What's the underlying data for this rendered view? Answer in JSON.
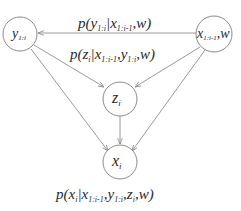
{
  "diagram": {
    "type": "graphical-model",
    "nodes": [
      {
        "id": "y",
        "main": "y",
        "sub": "1:i",
        "tail": ""
      },
      {
        "id": "xw",
        "main": "x",
        "sub": "1:i-1",
        "tail": ",w"
      },
      {
        "id": "z",
        "main": "z",
        "sub": "i",
        "tail": ""
      },
      {
        "id": "x",
        "main": "x",
        "sub": "i",
        "tail": ""
      }
    ],
    "edges": [
      {
        "from": "xw",
        "to": "y"
      },
      {
        "from": "xw",
        "to": "z"
      },
      {
        "from": "y",
        "to": "z"
      },
      {
        "from": "y",
        "to": "x"
      },
      {
        "from": "xw",
        "to": "x"
      },
      {
        "from": "z",
        "to": "x"
      }
    ],
    "labels": {
      "top": {
        "parts": [
          {
            "t": "p(y",
            "s": false
          },
          {
            "t": "1:i",
            "s": true
          },
          {
            "t": "|x",
            "s": false
          },
          {
            "t": "1:i-1",
            "s": true
          },
          {
            "t": ",w)",
            "s": false
          }
        ]
      },
      "middle": {
        "parts": [
          {
            "t": "p(z",
            "s": false
          },
          {
            "t": "i",
            "s": true
          },
          {
            "t": "|x",
            "s": false
          },
          {
            "t": "1:i-1",
            "s": true
          },
          {
            "t": ",y",
            "s": false
          },
          {
            "t": "1:i",
            "s": true
          },
          {
            "t": ",w)",
            "s": false
          }
        ]
      },
      "bottom": {
        "parts": [
          {
            "t": "p(x",
            "s": false
          },
          {
            "t": "i",
            "s": true
          },
          {
            "t": "|x",
            "s": false
          },
          {
            "t": "1:i-1",
            "s": true
          },
          {
            "t": ",y",
            "s": false
          },
          {
            "t": "1:i",
            "s": true
          },
          {
            "t": ",z",
            "s": false
          },
          {
            "t": "i",
            "s": true
          },
          {
            "t": ",w)",
            "s": false
          }
        ]
      }
    }
  }
}
